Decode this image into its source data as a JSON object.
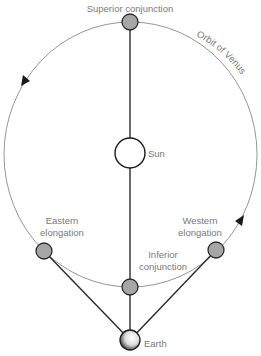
{
  "diagram": {
    "type": "orbital-geometry",
    "colors": {
      "label": "#7a7a7a",
      "orbit": "#8a8a8a",
      "line": "#2a2a2a",
      "venus_fill": "#a6a6a6",
      "sun_fill": "#ffffff"
    },
    "orbit": {
      "label": "Orbit of Venus",
      "center": [
        130.5,
        154.5
      ],
      "rx": 126.5,
      "ry": 132.5,
      "direction": "counter-clockwise (as seen)"
    },
    "bodies": {
      "sun": {
        "label": "Sun",
        "x": 130,
        "y": 153,
        "r": 15
      },
      "earth": {
        "label": "Earth",
        "x": 130,
        "y": 340,
        "r": 10
      }
    },
    "venus_positions": [
      {
        "id": "superior-conjunction",
        "label": "Superior conjunction",
        "x": 130,
        "y": 22
      },
      {
        "id": "eastern-elongation",
        "label_line1": "Eastern",
        "label_line2": "elongation",
        "x": 44,
        "y": 251
      },
      {
        "id": "inferior-conjunction",
        "label_line1": "Inferior",
        "label_line2": "conjunction",
        "x": 130,
        "y": 287
      },
      {
        "id": "western-elongation",
        "label_line1": "Western",
        "label_line2": "elongation",
        "x": 216,
        "y": 250
      }
    ],
    "labels": {
      "superior": "Superior conjunction",
      "sun": "Sun",
      "orbit": "Orbit of Venus",
      "eastern_1": "Eastern",
      "eastern_2": "elongation",
      "western_1": "Western",
      "western_2": "elongation",
      "inferior_1": "Inferior",
      "inferior_2": "conjunction",
      "earth": "Earth"
    },
    "arrows": [
      {
        "x": 26,
        "y": 80,
        "direction": "down-left"
      },
      {
        "x": 240,
        "y": 221,
        "direction": "up-right"
      }
    ]
  }
}
